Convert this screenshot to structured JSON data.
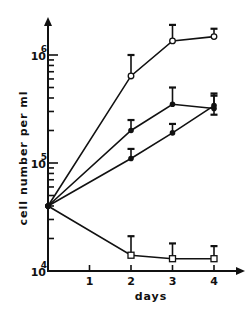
{
  "chart_data": {
    "type": "line",
    "title": "",
    "xlabel": "days",
    "ylabel": "cell number per ml",
    "yscale": "log",
    "ylim": [
      10000,
      2000000
    ],
    "xlim": [
      0,
      4.6
    ],
    "x_ticks": [
      1,
      2,
      3,
      4
    ],
    "x_tick_labels": [
      "1",
      "2",
      "3",
      "4"
    ],
    "y_major_ticks": [
      {
        "value": 10000,
        "base": "10",
        "exp": "4"
      },
      {
        "value": 100000,
        "base": "10",
        "exp": "5"
      },
      {
        "value": 1000000,
        "base": "10",
        "exp": "6"
      }
    ],
    "grid": false,
    "legend": null,
    "x": [
      0,
      2,
      3,
      4
    ],
    "series": [
      {
        "name": "open-circles",
        "marker": "open-circle",
        "values": [
          40000,
          640000,
          1350000,
          1480000
        ],
        "err_upper": [
          null,
          1000000,
          1900000,
          1750000
        ]
      },
      {
        "name": "filled-circles-upper",
        "marker": "filled-circle",
        "values": [
          40000,
          200000,
          350000,
          320000
        ],
        "err_upper": [
          null,
          250000,
          500000,
          440000
        ]
      },
      {
        "name": "filled-circles-lower",
        "marker": "filled-circle",
        "values": [
          40000,
          110000,
          190000,
          340000
        ],
        "err_upper": [
          null,
          135000,
          230000,
          420000
        ],
        "err_lower": [
          null,
          null,
          null,
          280000
        ]
      },
      {
        "name": "open-squares",
        "marker": "open-square",
        "values": [
          40000,
          14000,
          13000,
          13000
        ],
        "err_upper": [
          null,
          21000,
          18000,
          17000
        ]
      }
    ]
  },
  "axes": {
    "x_label": "days",
    "y_label": "cell number per ml"
  }
}
